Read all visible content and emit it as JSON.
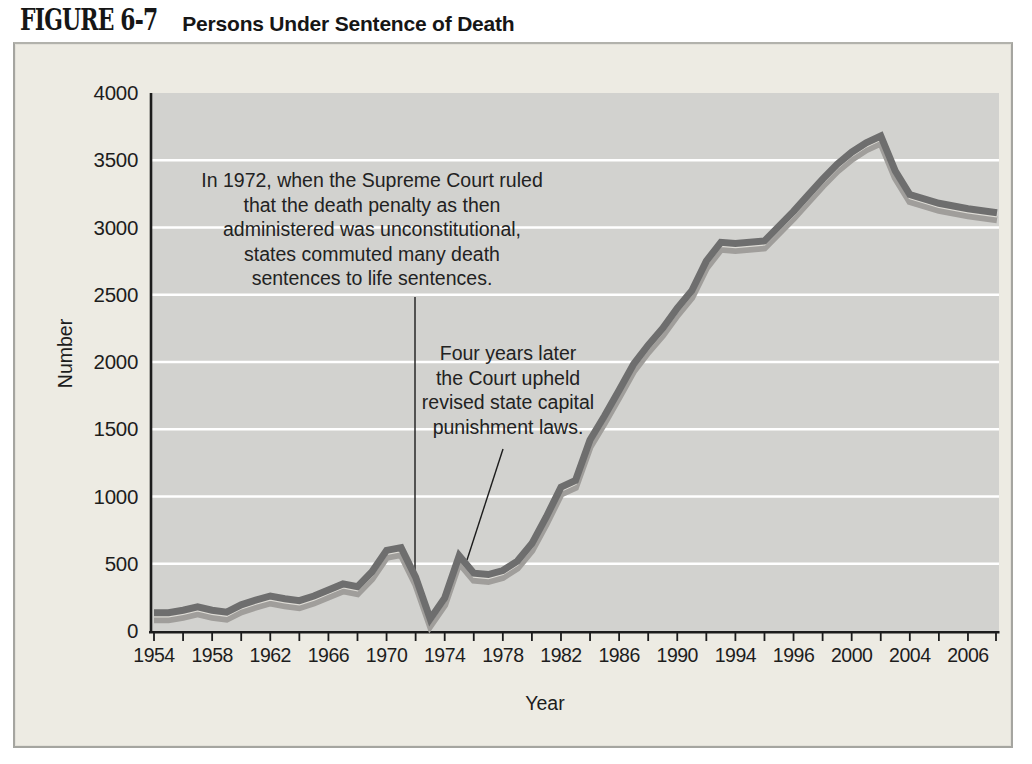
{
  "figure": {
    "label": "FIGURE 6-7",
    "title": "Persons Under Sentence of Death"
  },
  "chart_data": {
    "type": "line",
    "title": "Persons Under Sentence of Death",
    "xlabel": "Year",
    "ylabel": "Number",
    "ylim": [
      0,
      4000
    ],
    "yticks": [
      0,
      500,
      1000,
      1500,
      2000,
      2500,
      3000,
      3500,
      4000
    ],
    "xtick_labels": [
      "1954",
      "1958",
      "1962",
      "1966",
      "1970",
      "1974",
      "1978",
      "1982",
      "1986",
      "1990",
      "1994",
      "1996",
      "2000",
      "2004",
      "2006"
    ],
    "grid": "horizontal white gridlines on gray plot area, legend none",
    "series": [
      {
        "name": "Persons under sentence of death",
        "points": [
          [
            1954,
            135
          ],
          [
            1955,
            135
          ],
          [
            1956,
            155
          ],
          [
            1957,
            180
          ],
          [
            1958,
            155
          ],
          [
            1959,
            140
          ],
          [
            1960,
            195
          ],
          [
            1961,
            230
          ],
          [
            1962,
            260
          ],
          [
            1963,
            240
          ],
          [
            1964,
            225
          ],
          [
            1965,
            260
          ],
          [
            1966,
            305
          ],
          [
            1967,
            350
          ],
          [
            1968,
            330
          ],
          [
            1969,
            440
          ],
          [
            1970,
            600
          ],
          [
            1971,
            620
          ],
          [
            1972,
            400
          ],
          [
            1973,
            90
          ],
          [
            1974,
            245
          ],
          [
            1975,
            560
          ],
          [
            1976,
            430
          ],
          [
            1977,
            420
          ],
          [
            1978,
            450
          ],
          [
            1979,
            520
          ],
          [
            1980,
            650
          ],
          [
            1981,
            850
          ],
          [
            1982,
            1070
          ],
          [
            1983,
            1120
          ],
          [
            1984,
            1420
          ],
          [
            1985,
            1600
          ],
          [
            1986,
            1790
          ],
          [
            1987,
            1985
          ],
          [
            1988,
            2125
          ],
          [
            1989,
            2250
          ],
          [
            1990,
            2400
          ],
          [
            1991,
            2530
          ],
          [
            1992,
            2750
          ],
          [
            1993,
            2890
          ],
          [
            1994,
            2880
          ],
          [
            1995,
            2900
          ],
          [
            1996,
            3120
          ],
          [
            1997,
            3240
          ],
          [
            1998,
            3360
          ],
          [
            1999,
            3470
          ],
          [
            2000,
            3560
          ],
          [
            2001,
            3630
          ],
          [
            2002,
            3680
          ],
          [
            2003,
            3420
          ],
          [
            2004,
            3245
          ],
          [
            2005,
            3180
          ],
          [
            2006,
            3140
          ],
          [
            2007,
            3110
          ]
        ]
      }
    ],
    "annotations": [
      {
        "id": "ruling-1972",
        "text": "In 1972, when the Supreme Court ruled\nthat the death penalty as then\nadministered was unconstitutional,\nstates commuted many death\nsentences to life sentences.",
        "callout": [
          400,
          253,
          400,
          526
        ]
      },
      {
        "id": "ruling-1976",
        "text": "Four years later\nthe Court upheld\nrevised state capital\npunishment laws.",
        "callout": [
          488,
          405,
          452,
          516
        ]
      }
    ],
    "colors": {
      "figure_background": "#edebe3",
      "plot_background": "#d2d2cf",
      "gridline": "#ffffff",
      "axis": "#1c1c1c",
      "line_dark": "#6e6e6e",
      "line_light": "#a09e9b",
      "line_separator": "#dedcd6",
      "text": "#1d1d1d"
    }
  }
}
